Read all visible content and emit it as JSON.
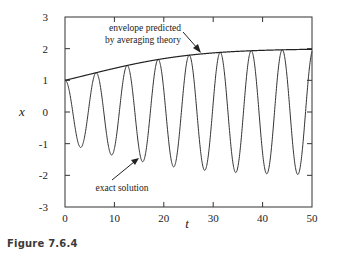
{
  "figure": {
    "caption": "Figure 7.6.4"
  },
  "chart_data": {
    "type": "line",
    "title": "",
    "xlabel": "t",
    "ylabel": "x",
    "xlim": [
      0,
      50
    ],
    "ylim": [
      -3,
      3
    ],
    "xticks": [
      0,
      10,
      20,
      30,
      40,
      50
    ],
    "yticks": [
      3,
      2,
      1,
      0,
      -1,
      -2,
      -3
    ],
    "grid": false,
    "legend": null,
    "annotations": [
      {
        "text_lines": [
          "envelope predicted",
          "by averaging theory"
        ],
        "points_to": "envelope"
      },
      {
        "text_lines": [
          "exact solution"
        ],
        "points_to": "exact-solution"
      }
    ],
    "series": [
      {
        "name": "exact solution",
        "description": "oscillation x(t) with period ~2π, starting at x(0)=1, amplitude growing toward 2",
        "minima": [
          {
            "t": 3.4,
            "x": -1.1
          },
          {
            "t": 9.5,
            "x": -1.35
          },
          {
            "t": 15.8,
            "x": -1.55
          },
          {
            "t": 22.0,
            "x": -1.7
          },
          {
            "t": 28.3,
            "x": -1.8
          },
          {
            "t": 34.6,
            "x": -1.9
          },
          {
            "t": 40.8,
            "x": -1.95
          },
          {
            "t": 47.1,
            "x": -1.95
          }
        ],
        "maxima": [
          {
            "t": 0.0,
            "x": 1.0
          },
          {
            "t": 6.3,
            "x": 1.22
          },
          {
            "t": 12.6,
            "x": 1.45
          },
          {
            "t": 18.9,
            "x": 1.63
          },
          {
            "t": 25.1,
            "x": 1.77
          },
          {
            "t": 31.4,
            "x": 1.86
          },
          {
            "t": 37.7,
            "x": 1.92
          },
          {
            "t": 44.0,
            "x": 1.96
          },
          {
            "t": 50.0,
            "x": 1.98
          }
        ]
      },
      {
        "name": "envelope predicted by averaging theory",
        "t": [
          0,
          5,
          10,
          15,
          20,
          25,
          30,
          35,
          40,
          45,
          50
        ],
        "x": [
          1.0,
          1.19,
          1.4,
          1.58,
          1.73,
          1.83,
          1.9,
          1.94,
          1.97,
          1.98,
          1.99
        ]
      }
    ],
    "model": {
      "omega": 1.0,
      "epsilon": 0.1,
      "envelope_formula": "r(t) = 2/sqrt(1+3e^{-εt})"
    }
  }
}
